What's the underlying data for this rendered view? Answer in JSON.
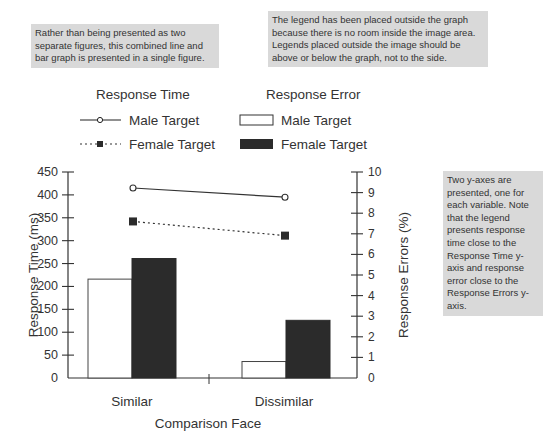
{
  "annotations": {
    "note_top_left": "Rather than being presented as two separate figures, this combined line and bar graph is presented in a single figure.",
    "note_top_right": "The legend has been placed outside the graph because there is no room inside the image area. Legends placed outside the image should be above or below the graph, not to the side.",
    "note_right": "Two y-axes are presented, one for each variable. Note that the legend presents response time close to the Response Time y-axis and response error close to the Response Errors y-axis."
  },
  "legend": {
    "line_group_title": "Response Time",
    "bar_group_title": "Response Error",
    "line_male": "Male Target",
    "line_female": "Female Target",
    "bar_male": "Male Target",
    "bar_female": "Female Target"
  },
  "axes": {
    "left_label": "Response Time (ms)",
    "right_label": "Response Errors (%)",
    "x_label": "Comparison Face",
    "left_ticks": [
      "0",
      "50",
      "100",
      "150",
      "200",
      "250",
      "300",
      "350",
      "400",
      "450"
    ],
    "right_ticks": [
      "0",
      "1",
      "2",
      "3",
      "4",
      "5",
      "6",
      "7",
      "8",
      "9",
      "10"
    ],
    "categories": [
      "Similar",
      "Dissimilar"
    ]
  },
  "chart_data": {
    "type": "bar+line",
    "title": "",
    "categories": [
      "Similar",
      "Dissimilar"
    ],
    "xlabel": "Comparison Face",
    "ylabel_left": "Response Time (ms)",
    "ylabel_right": "Response Errors (%)",
    "ylim_left": [
      0,
      450
    ],
    "ylim_right": [
      0,
      10
    ],
    "grid": false,
    "legend_position": "above",
    "series": [
      {
        "name": "Response Time - Male Target",
        "type": "line",
        "axis": "left",
        "style": "solid, open circle marker",
        "values": [
          415,
          395
        ]
      },
      {
        "name": "Response Time - Female Target",
        "type": "line",
        "axis": "left",
        "style": "dotted, filled square marker",
        "values": [
          342,
          311
        ]
      },
      {
        "name": "Response Error - Male Target",
        "type": "bar",
        "axis": "right",
        "color": "#ffffff",
        "values": [
          4.8,
          0.8
        ]
      },
      {
        "name": "Response Error - Female Target",
        "type": "bar",
        "axis": "right",
        "color": "#2b2b2b",
        "values": [
          5.8,
          2.8
        ]
      }
    ]
  }
}
